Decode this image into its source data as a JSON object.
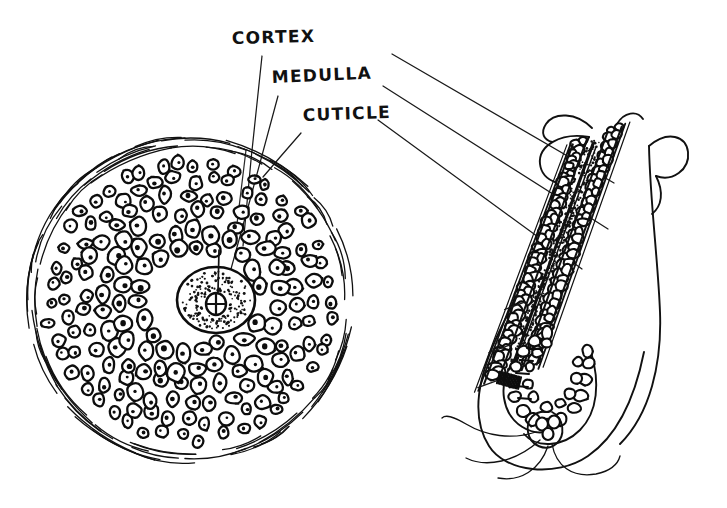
{
  "figure": {
    "style": "hand-drawn ink line art",
    "background_color": "#ffffff",
    "ink_color": "#111111",
    "width": 727,
    "height": 508
  },
  "labels": [
    {
      "id": "cortex",
      "text": "CORTEX",
      "x": 232,
      "y": 44,
      "name": "label-cortex"
    },
    {
      "id": "medulla",
      "text": "MEDULLA",
      "x": 272,
      "y": 83,
      "name": "label-medulla"
    },
    {
      "id": "cuticle",
      "text": "CUTICLE",
      "x": 303,
      "y": 121,
      "name": "label-cuticle"
    }
  ],
  "leader_lines": {
    "to_cross_section": [
      {
        "label": "cortex",
        "x1": 262,
        "y1": 56,
        "x2": 242,
        "y2": 245
      },
      {
        "label": "medulla",
        "x1": 277,
        "y1": 95,
        "x2": 222,
        "y2": 300
      },
      {
        "label": "cuticle",
        "x1": 300,
        "y1": 133,
        "x2": 262,
        "y2": 176
      }
    ],
    "to_longitudinal": [
      {
        "label": "cortex",
        "x1": 392,
        "y1": 54,
        "x2": 612,
        "y2": 182
      },
      {
        "label": "medulla",
        "x1": 383,
        "y1": 86,
        "x2": 607,
        "y2": 228
      },
      {
        "label": "cuticle",
        "x1": 378,
        "y1": 120,
        "x2": 580,
        "y2": 268
      }
    ]
  },
  "cross_section": {
    "name": "hair-cross-section",
    "center_x": 190,
    "center_y": 300,
    "radius": 152,
    "cuticle_layer": "outer flicked arc strokes",
    "cortex_layer": "concentric rings of nucleated cells",
    "medulla": {
      "center_x": 216,
      "center_y": 300,
      "radius_x": 38,
      "radius_y": 32,
      "fill": "stippled"
    },
    "cell_rings": [
      {
        "radius": 140,
        "count": 46,
        "cell_size": 9
      },
      {
        "radius": 123,
        "count": 40,
        "cell_size": 10
      },
      {
        "radius": 106,
        "count": 34,
        "cell_size": 11
      },
      {
        "radius": 89,
        "count": 28,
        "cell_size": 12
      },
      {
        "radius": 71,
        "count": 23,
        "cell_size": 13
      },
      {
        "radius": 54,
        "count": 18,
        "cell_size": 13
      }
    ]
  },
  "longitudinal_section": {
    "name": "hair-longitudinal-section",
    "description": "hair shaft in follicle with bulb and dermal papilla at base",
    "shaft_angle_deg": 20,
    "top_x": 600,
    "top_y": 128,
    "bulb_x": 528,
    "bulb_y": 400,
    "layers": [
      "cuticle",
      "cortex",
      "medulla"
    ],
    "medulla_fill": "stippled strip",
    "root_structure": "dermal papilla spiral with wispy tail strokes"
  }
}
